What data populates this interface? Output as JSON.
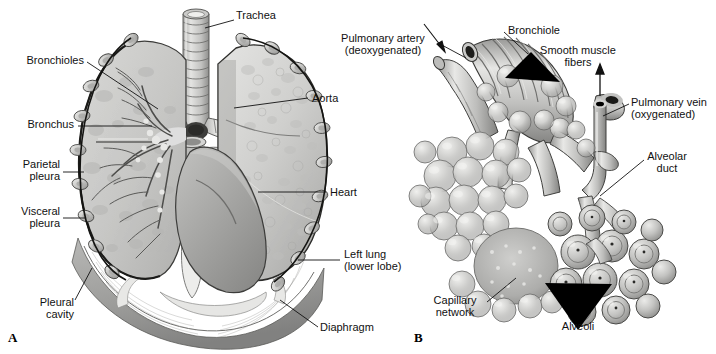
{
  "figure": {
    "type": "anatomical-illustration",
    "style": "grayscale pencil/airbrush medical illustration",
    "background_color": "#ffffff",
    "line_color": "#111111"
  },
  "panels": [
    {
      "id": "A",
      "letter": "A",
      "caption": "Anterior view of lungs in the thoracic cavity with left lung sectioned to show the bronchial tree"
    },
    {
      "id": "B",
      "letter": "B",
      "caption": "Detail of a terminal bronchiole with alveolar sacs and capillary network"
    }
  ],
  "panel_a": {
    "letter": "A",
    "labels": [
      {
        "id": "trachea",
        "text": "Trachea",
        "align": "left"
      },
      {
        "id": "bronchioles",
        "text": "Bronchioles",
        "align": "right"
      },
      {
        "id": "bronchus",
        "text": "Bronchus",
        "align": "right"
      },
      {
        "id": "parietal_pleura",
        "text": "Parietal\npleura",
        "align": "right"
      },
      {
        "id": "visceral_pleura",
        "text": "Visceral\npleura",
        "align": "right"
      },
      {
        "id": "pleural_cavity",
        "text": "Pleural\ncavity",
        "align": "right"
      },
      {
        "id": "aorta",
        "text": "Aorta",
        "align": "left"
      },
      {
        "id": "heart",
        "text": "Heart",
        "align": "left"
      },
      {
        "id": "left_lung",
        "text": "Left lung\n(lower lobe)",
        "align": "left"
      },
      {
        "id": "diaphragm",
        "text": "Diaphragm",
        "align": "left"
      }
    ]
  },
  "panel_b": {
    "letter": "B",
    "labels": [
      {
        "id": "pulmonary_artery",
        "text": "Pulmonary artery\n(deoxygenated)",
        "align": "right"
      },
      {
        "id": "bronchiole",
        "text": "Bronchiole",
        "align": "left"
      },
      {
        "id": "smooth_muscle_fibers",
        "text": "Smooth muscle\nfibers",
        "align": "left"
      },
      {
        "id": "pulmonary_vein",
        "text": "Pulmonary vein\n(oxygenated)",
        "align": "left"
      },
      {
        "id": "alveolar_duct",
        "text": "Alveolar\nduct",
        "align": "left"
      },
      {
        "id": "capillary_network",
        "text": "Capillary\nnetwork",
        "align": "right"
      },
      {
        "id": "alveoli",
        "text": "Alveoli",
        "align": "left"
      }
    ]
  }
}
